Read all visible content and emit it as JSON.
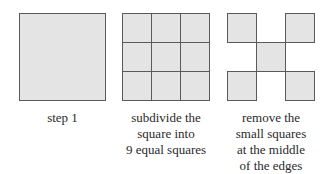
{
  "diagram": {
    "colors": {
      "fill": "#e4e4e4",
      "stroke": "#5a5a5a",
      "text": "#2a2a2a"
    },
    "steps": [
      {
        "caption_lines": [
          "step 1"
        ]
      },
      {
        "caption_lines": [
          "subdivide the",
          "square into",
          "9 equal squares"
        ]
      },
      {
        "caption_lines": [
          "remove the",
          "small squares",
          "at the middle",
          "of the edges"
        ]
      }
    ]
  }
}
